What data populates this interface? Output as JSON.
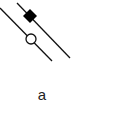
{
  "diagram": {
    "caption": "a",
    "lines": [
      {
        "name": "left-line",
        "x1": 0,
        "y1": 8,
        "x2": 52,
        "y2": 61
      },
      {
        "name": "right-line",
        "x1": 17,
        "y1": 3,
        "x2": 70,
        "y2": 58
      }
    ],
    "markers": [
      {
        "name": "filled-diamond",
        "shape": "diamond",
        "cx": 30,
        "cy": 16,
        "size": 7,
        "fill": "#000000"
      },
      {
        "name": "open-circle",
        "shape": "circle",
        "cx": 31,
        "cy": 39,
        "r": 5,
        "fill": "#ffffff"
      }
    ],
    "colors": {
      "stroke": "#111111",
      "background": "#ffffff"
    }
  }
}
